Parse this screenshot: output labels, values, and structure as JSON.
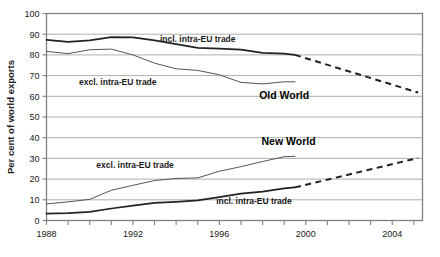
{
  "chart_data": {
    "type": "line",
    "title": "",
    "xlabel": "",
    "ylabel": "Per cent of world exports",
    "xlim": [
      1988,
      2005.4
    ],
    "ylim": [
      0,
      100
    ],
    "grid": true,
    "legend_position": "inline-annotations",
    "y_ticks": [
      0,
      10,
      20,
      30,
      40,
      50,
      60,
      70,
      80,
      90,
      100
    ],
    "y_tick_labels": [
      "0",
      "10",
      "20",
      "30",
      "40",
      "50",
      "60",
      "70",
      "80",
      "90",
      "100"
    ],
    "x_ticks": [
      1988,
      1989,
      1990,
      1991,
      1992,
      1993,
      1994,
      1995,
      1996,
      1997,
      1998,
      1999,
      2000,
      2001,
      2002,
      2003,
      2004,
      2005
    ],
    "x_tick_labels_shown": [
      "1988",
      "1992",
      "1996",
      "2000",
      "2004"
    ],
    "x_tick_labels_shown_at": [
      1988,
      1992,
      1996,
      2000,
      2004
    ],
    "annotations": [
      {
        "text": "incl. intra-EU trade",
        "x": 1995.0,
        "y": 86.0,
        "series": "old-world-incl"
      },
      {
        "text": "excl. intra-EU trade",
        "x": 1991.3,
        "y": 65.5,
        "series": "old-world-excl"
      },
      {
        "text": "Old World",
        "x": 1999.0,
        "y": 58.5,
        "series": "old-world-group"
      },
      {
        "text": "New World",
        "x": 1999.2,
        "y": 36.5,
        "series": "new-world-group"
      },
      {
        "text": "excl. intra-EU trade",
        "x": 1992.1,
        "y": 25.5,
        "series": "new-world-excl"
      },
      {
        "text": "incl. intra-EU trade",
        "x": 1997.6,
        "y": 8.0,
        "series": "new-world-incl"
      }
    ],
    "series": [
      {
        "name": "Old World incl. intra-EU trade",
        "group": "Old World",
        "measure": "incl. intra-EU trade",
        "style": "solid-thick",
        "color": "#222222",
        "x": [
          1988,
          1989,
          1990,
          1991,
          1992,
          1993,
          1994,
          1995,
          1996,
          1997,
          1998,
          1999,
          1999.5
        ],
        "values": [
          87.3,
          86.3,
          87.0,
          88.6,
          88.5,
          87.0,
          85.2,
          83.4,
          83.0,
          82.5,
          81.0,
          80.6,
          80.0
        ]
      },
      {
        "name": "Old World incl. intra-EU trade (projected)",
        "group": "Old World",
        "measure": "incl. intra-EU trade",
        "style": "dashed-thick",
        "color": "#222222",
        "x": [
          1999.5,
          2005.2
        ],
        "values": [
          80.0,
          61.8
        ]
      },
      {
        "name": "Old World excl. intra-EU trade",
        "group": "Old World",
        "measure": "excl. intra-EU trade",
        "style": "solid-thin",
        "color": "#555555",
        "x": [
          1988,
          1989,
          1990,
          1991,
          1992,
          1993,
          1994,
          1995,
          1996,
          1997,
          1998,
          1999,
          1999.5
        ],
        "values": [
          81.7,
          80.6,
          82.5,
          82.8,
          80.0,
          76.0,
          73.3,
          72.5,
          70.4,
          66.7,
          66.0,
          67.0,
          67.0
        ]
      },
      {
        "name": "New World excl. intra-EU trade",
        "group": "New World",
        "measure": "excl. intra-EU trade",
        "style": "solid-thin",
        "color": "#555555",
        "x": [
          1988,
          1989,
          1990,
          1991,
          1992,
          1993,
          1994,
          1995,
          1996,
          1997,
          1998,
          1999,
          1999.5
        ],
        "values": [
          8.0,
          9.0,
          10.2,
          14.6,
          17.0,
          19.3,
          20.3,
          20.6,
          23.8,
          26.0,
          28.5,
          30.8,
          31.0
        ]
      },
      {
        "name": "New World incl. intra-EU trade",
        "group": "New World",
        "measure": "incl. intra-EU trade",
        "style": "solid-thick",
        "color": "#222222",
        "x": [
          1988,
          1989,
          1990,
          1991,
          1992,
          1993,
          1994,
          1995,
          1996,
          1997,
          1998,
          1999,
          1999.5
        ],
        "values": [
          3.3,
          3.6,
          4.2,
          5.8,
          7.2,
          8.5,
          9.0,
          9.7,
          11.3,
          13.0,
          14.0,
          15.5,
          16.0
        ]
      },
      {
        "name": "New World incl. intra-EU trade (projected)",
        "group": "New World",
        "measure": "incl. intra-EU trade",
        "style": "dashed-thick",
        "color": "#222222",
        "x": [
          1999.5,
          2005.2
        ],
        "values": [
          16.0,
          30.2
        ]
      }
    ],
    "colors": {
      "frame": "#808080",
      "gridline": "#999999",
      "thick_line": "#222222",
      "thin_line": "#555555",
      "text": "#1a1a1a",
      "background": "#ffffff"
    }
  }
}
